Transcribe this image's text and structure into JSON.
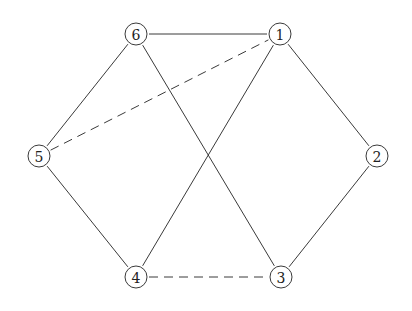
{
  "diagram": {
    "type": "graph",
    "nodes": [
      {
        "id": "1",
        "label": "1",
        "x": 280,
        "y": 34
      },
      {
        "id": "2",
        "label": "2",
        "x": 377,
        "y": 156
      },
      {
        "id": "3",
        "label": "3",
        "x": 281,
        "y": 277
      },
      {
        "id": "4",
        "label": "4",
        "x": 136,
        "y": 277
      },
      {
        "id": "5",
        "label": "5",
        "x": 39,
        "y": 156
      },
      {
        "id": "6",
        "label": "6",
        "x": 136,
        "y": 34
      }
    ],
    "edges": [
      {
        "from": "6",
        "to": "1",
        "style": "solid"
      },
      {
        "from": "1",
        "to": "2",
        "style": "solid"
      },
      {
        "from": "2",
        "to": "3",
        "style": "solid"
      },
      {
        "from": "6",
        "to": "5",
        "style": "solid"
      },
      {
        "from": "5",
        "to": "4",
        "style": "solid"
      },
      {
        "from": "6",
        "to": "3",
        "style": "solid"
      },
      {
        "from": "1",
        "to": "4",
        "style": "solid"
      },
      {
        "from": "5",
        "to": "1",
        "style": "dashed"
      },
      {
        "from": "4",
        "to": "3",
        "style": "dashed"
      }
    ]
  }
}
